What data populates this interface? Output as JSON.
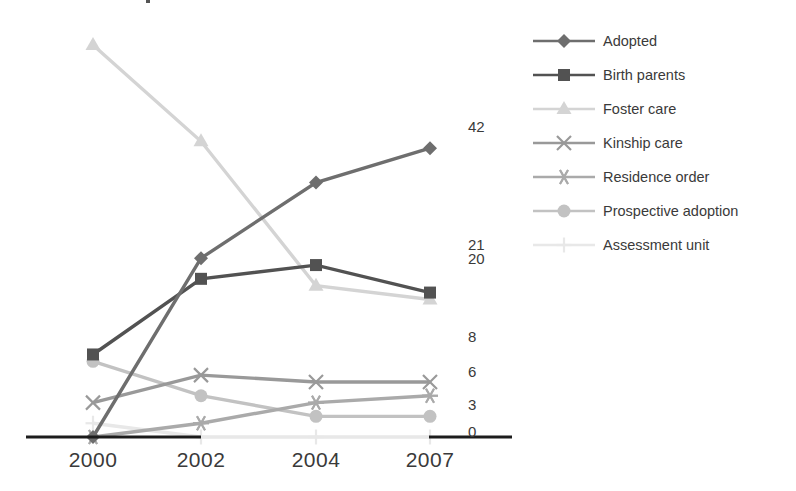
{
  "chart_data": {
    "type": "line",
    "title": "",
    "subtitle": "",
    "xlabel": "",
    "ylabel": "",
    "grid": false,
    "legend_position": "right",
    "categories": [
      "2000",
      "2002",
      "2004",
      "2007"
    ],
    "x": [
      2000,
      2002,
      2004,
      2007
    ],
    "ylim": [
      0,
      60
    ],
    "end_labels": [
      "42",
      "21",
      "20",
      "8",
      "6",
      "3",
      "0"
    ],
    "series": [
      {
        "name": "Adopted",
        "marker": "diamond",
        "color": "#6e6e6e",
        "end_value": "42",
        "values": [
          0,
          26,
          37,
          42
        ]
      },
      {
        "name": "Birth parents",
        "marker": "square",
        "color": "#525252",
        "end_value": "21",
        "values": [
          12,
          23,
          25,
          21
        ]
      },
      {
        "name": "Foster care",
        "marker": "triangle",
        "color": "#d4d4d4",
        "end_value": "20",
        "values": [
          57,
          43,
          22,
          20
        ]
      },
      {
        "name": "Kinship care",
        "marker": "cross",
        "color": "#999999",
        "end_value": "8",
        "values": [
          5,
          9,
          8,
          8
        ]
      },
      {
        "name": "Residence order",
        "marker": "asterisk",
        "color": "#aaaaaa",
        "end_value": "6",
        "values": [
          0,
          2,
          5,
          6
        ]
      },
      {
        "name": "Prospective adoption",
        "marker": "circle",
        "color": "#c2c2c2",
        "end_value": "3",
        "values": [
          11,
          6,
          3,
          3
        ]
      },
      {
        "name": "Assessment unit",
        "marker": "plus",
        "color": "#e8e8e8",
        "end_value": "0",
        "values": [
          2,
          0,
          0,
          0
        ]
      }
    ]
  },
  "axis": {
    "x_ticks": [
      "2000",
      "2002",
      "2004",
      "2007"
    ]
  },
  "legend": {
    "items": [
      {
        "label": "Adopted"
      },
      {
        "label": "Birth parents"
      },
      {
        "label": "Foster care"
      },
      {
        "label": "Kinship care"
      },
      {
        "label": "Residence order"
      },
      {
        "label": "Prospective adoption"
      },
      {
        "label": "Assessment unit"
      }
    ]
  },
  "end_value_labels": [
    {
      "text": "42"
    },
    {
      "text": "21"
    },
    {
      "text": "20"
    },
    {
      "text": "8"
    },
    {
      "text": "6"
    },
    {
      "text": "3"
    },
    {
      "text": "0"
    }
  ]
}
